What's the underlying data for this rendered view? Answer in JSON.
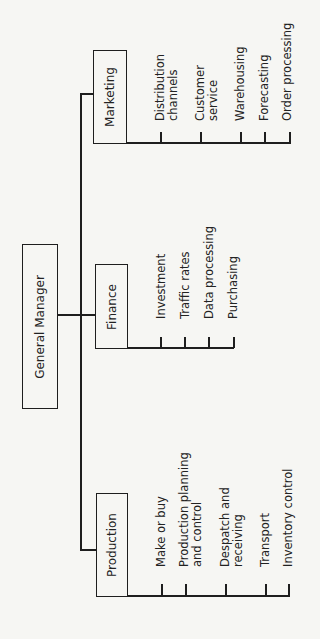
{
  "diagram": {
    "type": "org-chart",
    "orientation": "rotated-90-ccw",
    "root": {
      "label": "General Manager"
    },
    "departments": [
      {
        "label": "Marketing",
        "functions": [
          [
            "Distribution",
            "channels"
          ],
          [
            "Customer",
            "service"
          ],
          [
            "Warehousing"
          ],
          [
            "Forecasting"
          ],
          [
            "Order processing"
          ]
        ]
      },
      {
        "label": "Finance",
        "functions": [
          [
            "Investment"
          ],
          [
            "Traffic rates"
          ],
          [
            "Data processing"
          ],
          [
            "Purchasing"
          ]
        ]
      },
      {
        "label": "Production",
        "functions": [
          [
            "Make or buy"
          ],
          [
            "Production planning",
            "and control"
          ],
          [
            "Despatch and",
            "receiving"
          ],
          [
            "Transport"
          ],
          [
            "Inventory control"
          ]
        ]
      }
    ]
  },
  "colors": {
    "background": "#f6f6f3",
    "ink": "#1e1e1e"
  }
}
